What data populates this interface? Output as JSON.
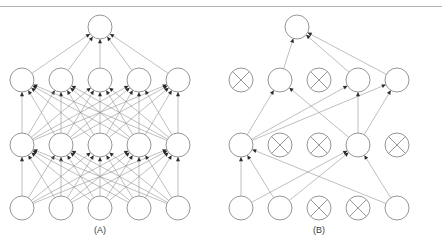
{
  "figure": {
    "width": 442,
    "height": 249,
    "background_color": "#ffffff",
    "rule_color": "#b4b4b4",
    "node_stroke_color": "#8a8a8a",
    "edge_color": "#8a8a8a",
    "arrowhead_color": "#2b2b2b",
    "label_color": "#3a3a3a"
  },
  "panels": [
    {
      "id": "panel-a",
      "label": "(A)",
      "label_x": 100,
      "label_y": 233,
      "description": "Standard fully connected neural net",
      "center_x": 100,
      "layers": [
        {
          "name": "output-layer",
          "y": 27,
          "node_radius": 12,
          "nodes": [
            {
              "id": "a-out-1",
              "x": 100,
              "dropped": false
            }
          ]
        },
        {
          "name": "hidden-layer-2",
          "y": 80,
          "node_radius": 12,
          "nodes": [
            {
              "id": "a-h2-1",
              "x": 22,
              "dropped": false
            },
            {
              "id": "a-h2-2",
              "x": 61,
              "dropped": false
            },
            {
              "id": "a-h2-3",
              "x": 100,
              "dropped": false
            },
            {
              "id": "a-h2-4",
              "x": 139,
              "dropped": false
            },
            {
              "id": "a-h2-5",
              "x": 178,
              "dropped": false
            }
          ]
        },
        {
          "name": "hidden-layer-1",
          "y": 145,
          "node_radius": 12,
          "nodes": [
            {
              "id": "a-h1-1",
              "x": 22,
              "dropped": false
            },
            {
              "id": "a-h1-2",
              "x": 61,
              "dropped": false
            },
            {
              "id": "a-h1-3",
              "x": 100,
              "dropped": false
            },
            {
              "id": "a-h1-4",
              "x": 139,
              "dropped": false
            },
            {
              "id": "a-h1-5",
              "x": 178,
              "dropped": false
            }
          ]
        },
        {
          "name": "input-layer",
          "y": 208,
          "node_radius": 12,
          "nodes": [
            {
              "id": "a-in-1",
              "x": 22,
              "dropped": false
            },
            {
              "id": "a-in-2",
              "x": 61,
              "dropped": false
            },
            {
              "id": "a-in-3",
              "x": 100,
              "dropped": false
            },
            {
              "id": "a-in-4",
              "x": 139,
              "dropped": false
            },
            {
              "id": "a-in-5",
              "x": 178,
              "dropped": false
            }
          ]
        }
      ],
      "edges": [
        {
          "from": "a-h2-1",
          "to": "a-out-1"
        },
        {
          "from": "a-h2-2",
          "to": "a-out-1"
        },
        {
          "from": "a-h2-3",
          "to": "a-out-1"
        },
        {
          "from": "a-h2-4",
          "to": "a-out-1"
        },
        {
          "from": "a-h2-5",
          "to": "a-out-1"
        },
        {
          "from": "a-h1-1",
          "to": "a-h2-1"
        },
        {
          "from": "a-h1-1",
          "to": "a-h2-2"
        },
        {
          "from": "a-h1-1",
          "to": "a-h2-3"
        },
        {
          "from": "a-h1-1",
          "to": "a-h2-4"
        },
        {
          "from": "a-h1-1",
          "to": "a-h2-5"
        },
        {
          "from": "a-h1-2",
          "to": "a-h2-1"
        },
        {
          "from": "a-h1-2",
          "to": "a-h2-2"
        },
        {
          "from": "a-h1-2",
          "to": "a-h2-3"
        },
        {
          "from": "a-h1-2",
          "to": "a-h2-4"
        },
        {
          "from": "a-h1-2",
          "to": "a-h2-5"
        },
        {
          "from": "a-h1-3",
          "to": "a-h2-1"
        },
        {
          "from": "a-h1-3",
          "to": "a-h2-2"
        },
        {
          "from": "a-h1-3",
          "to": "a-h2-3"
        },
        {
          "from": "a-h1-3",
          "to": "a-h2-4"
        },
        {
          "from": "a-h1-3",
          "to": "a-h2-5"
        },
        {
          "from": "a-h1-4",
          "to": "a-h2-1"
        },
        {
          "from": "a-h1-4",
          "to": "a-h2-2"
        },
        {
          "from": "a-h1-4",
          "to": "a-h2-3"
        },
        {
          "from": "a-h1-4",
          "to": "a-h2-4"
        },
        {
          "from": "a-h1-4",
          "to": "a-h2-5"
        },
        {
          "from": "a-h1-5",
          "to": "a-h2-1"
        },
        {
          "from": "a-h1-5",
          "to": "a-h2-2"
        },
        {
          "from": "a-h1-5",
          "to": "a-h2-3"
        },
        {
          "from": "a-h1-5",
          "to": "a-h2-4"
        },
        {
          "from": "a-h1-5",
          "to": "a-h2-5"
        },
        {
          "from": "a-in-1",
          "to": "a-h1-1"
        },
        {
          "from": "a-in-1",
          "to": "a-h1-2"
        },
        {
          "from": "a-in-1",
          "to": "a-h1-3"
        },
        {
          "from": "a-in-1",
          "to": "a-h1-4"
        },
        {
          "from": "a-in-1",
          "to": "a-h1-5"
        },
        {
          "from": "a-in-2",
          "to": "a-h1-1"
        },
        {
          "from": "a-in-2",
          "to": "a-h1-2"
        },
        {
          "from": "a-in-2",
          "to": "a-h1-3"
        },
        {
          "from": "a-in-2",
          "to": "a-h1-4"
        },
        {
          "from": "a-in-2",
          "to": "a-h1-5"
        },
        {
          "from": "a-in-3",
          "to": "a-h1-1"
        },
        {
          "from": "a-in-3",
          "to": "a-h1-2"
        },
        {
          "from": "a-in-3",
          "to": "a-h1-3"
        },
        {
          "from": "a-in-3",
          "to": "a-h1-4"
        },
        {
          "from": "a-in-3",
          "to": "a-h1-5"
        },
        {
          "from": "a-in-4",
          "to": "a-h1-1"
        },
        {
          "from": "a-in-4",
          "to": "a-h1-2"
        },
        {
          "from": "a-in-4",
          "to": "a-h1-3"
        },
        {
          "from": "a-in-4",
          "to": "a-h1-4"
        },
        {
          "from": "a-in-4",
          "to": "a-h1-5"
        },
        {
          "from": "a-in-5",
          "to": "a-h1-1"
        },
        {
          "from": "a-in-5",
          "to": "a-h1-2"
        },
        {
          "from": "a-in-5",
          "to": "a-h1-3"
        },
        {
          "from": "a-in-5",
          "to": "a-h1-4"
        },
        {
          "from": "a-in-5",
          "to": "a-h1-5"
        }
      ]
    },
    {
      "id": "panel-b",
      "label": "(B)",
      "label_x": 319,
      "label_y": 233,
      "description": "After applying dropout; crossed units are dropped",
      "center_x": 319,
      "layers": [
        {
          "name": "output-layer",
          "y": 27,
          "node_radius": 12,
          "nodes": [
            {
              "id": "b-out-1",
              "x": 297,
              "dropped": false
            }
          ]
        },
        {
          "name": "hidden-layer-2",
          "y": 80,
          "node_radius": 12,
          "nodes": [
            {
              "id": "b-h2-1",
              "x": 241,
              "dropped": true
            },
            {
              "id": "b-h2-2",
              "x": 280,
              "dropped": false
            },
            {
              "id": "b-h2-3",
              "x": 319,
              "dropped": true
            },
            {
              "id": "b-h2-4",
              "x": 358,
              "dropped": false
            },
            {
              "id": "b-h2-5",
              "x": 397,
              "dropped": false
            }
          ]
        },
        {
          "name": "hidden-layer-1",
          "y": 145,
          "node_radius": 12,
          "nodes": [
            {
              "id": "b-h1-1",
              "x": 241,
              "dropped": false
            },
            {
              "id": "b-h1-2",
              "x": 280,
              "dropped": true
            },
            {
              "id": "b-h1-3",
              "x": 319,
              "dropped": true
            },
            {
              "id": "b-h1-4",
              "x": 358,
              "dropped": false
            },
            {
              "id": "b-h1-5",
              "x": 397,
              "dropped": true
            }
          ]
        },
        {
          "name": "input-layer",
          "y": 208,
          "node_radius": 12,
          "nodes": [
            {
              "id": "b-in-1",
              "x": 241,
              "dropped": false
            },
            {
              "id": "b-in-2",
              "x": 280,
              "dropped": false
            },
            {
              "id": "b-in-3",
              "x": 319,
              "dropped": true
            },
            {
              "id": "b-in-4",
              "x": 358,
              "dropped": true
            },
            {
              "id": "b-in-5",
              "x": 397,
              "dropped": false
            }
          ]
        }
      ],
      "edges": [
        {
          "from": "b-h2-2",
          "to": "b-out-1"
        },
        {
          "from": "b-h2-4",
          "to": "b-out-1"
        },
        {
          "from": "b-h2-5",
          "to": "b-out-1"
        },
        {
          "from": "b-h1-1",
          "to": "b-h2-2"
        },
        {
          "from": "b-h1-1",
          "to": "b-h2-4"
        },
        {
          "from": "b-h1-1",
          "to": "b-h2-5"
        },
        {
          "from": "b-h1-4",
          "to": "b-h2-2"
        },
        {
          "from": "b-h1-4",
          "to": "b-h2-4"
        },
        {
          "from": "b-h1-4",
          "to": "b-h2-5"
        },
        {
          "from": "b-in-1",
          "to": "b-h1-1"
        },
        {
          "from": "b-in-1",
          "to": "b-h1-4"
        },
        {
          "from": "b-in-2",
          "to": "b-h1-1"
        },
        {
          "from": "b-in-2",
          "to": "b-h1-4"
        },
        {
          "from": "b-in-5",
          "to": "b-h1-1"
        },
        {
          "from": "b-in-5",
          "to": "b-h1-4"
        }
      ]
    }
  ]
}
